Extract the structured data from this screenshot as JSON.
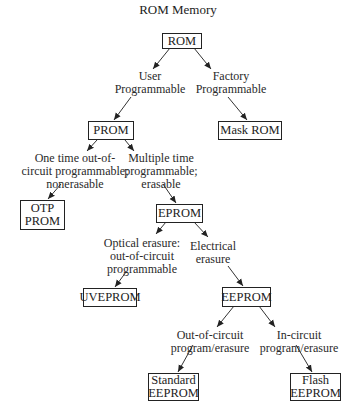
{
  "title": "ROM Memory",
  "nodes": {
    "rom": "ROM",
    "prom": "PROM",
    "mask_rom": "Mask ROM",
    "otp_prom": "OTP\nPROM",
    "eprom": "EPROM",
    "uveprom": "UVEPROM",
    "eeprom": "EEPROM",
    "standard_eeprom": "Standard\nEEPROM",
    "flash_eeprom": "Flash\nEEPROM"
  },
  "edge_labels": {
    "user_programmable": "User\nProgrammable",
    "factory_programmable": "Factory\nProgrammable",
    "one_time": "One time out-of-\ncircuit programmable;\nnonerasable",
    "multiple_time": "Multiple time\nprogrammable;\nerasable",
    "optical_erasure": "Optical erasure:\nout-of-circuit\nprogrammable",
    "electrical_erasure": "Electrical\nerasure",
    "out_of_circuit": "Out-of-circuit\nprogram/erasure",
    "in_circuit": "In-circuit\nprogram/erasure"
  }
}
